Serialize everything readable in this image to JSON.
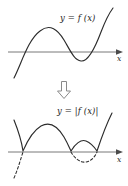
{
  "figure": {
    "stroke_color": "#2b2b2b",
    "axis_color": "#6a6a6a",
    "background": "#ffffff"
  },
  "top_panel": {
    "name": "graph of y = f(x)",
    "function_label": "y = f (x)",
    "axis_label": "x",
    "axis_y": 52,
    "curve_description": "cubic-like curve rising from lower left, crossing the x-axis, peaking above the axis, dipping below the axis, then rising steeply to the upper right",
    "curve_path": "M 14,78 C 22,62 28,40 40,31 C 50,23 58,30 64,40 C 70,50 74,60 81,61 C 88,62 95,48 101,32 C 106,19 110,12 113,8",
    "roots_x": [
      22,
      70,
      95
    ],
    "arrow_head": "right"
  },
  "transform_arrow": {
    "name": "downward block arrow",
    "glyph": "hollow-down-arrow",
    "fill": "#ffffff",
    "stroke": "#8a8a8a"
  },
  "bottom_panel": {
    "name": "graph of y = |f(x)|",
    "function_label": "y = |f (x)|",
    "axis_label": "x",
    "axis_y": 52,
    "curve_description": "same curve with the portions below the x-axis reflected upward; reflected parts shown solid while the original below-axis parts are shown dashed",
    "solid_path": "M 14,20 C 18,30 22,44 23,51 C 26,44 31,32 41,26 C 50,21 58,27 64,37 C 68,44 70,49 71,51 C 75,44 81,39 86,41 C 91,43 95,48 97,51 C 101,39 106,25 112,13",
    "dashed_path": "M 14,78 C 18,69 21,58 23,52 M 71,52 C 75,59 81,63 86,62 C 91,61 95,57 97,52",
    "roots_x": [
      23,
      71,
      97
    ],
    "arrow_head": "right"
  }
}
